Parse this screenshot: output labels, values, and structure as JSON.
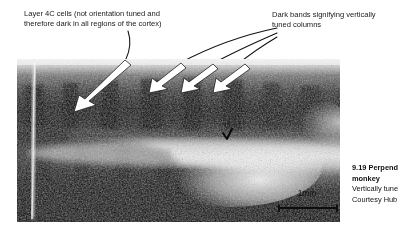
{
  "figure": {
    "type": "autoradiograph-micrograph",
    "annotations": {
      "left": {
        "text": "Layer 4C cells (not orientation tuned and\ntherefore dark in all regions of the cortex)",
        "line1": "Layer 4C cells (not orientation tuned and",
        "line2": "therefore dark in all regions of the cortex)",
        "arrow_count": 1
      },
      "right": {
        "text": "Dark bands signifying vertically\ntuned columns",
        "line1": "Dark bands signifying vertically",
        "line2": "tuned columns",
        "arrow_count": 3
      }
    },
    "scale_bar": {
      "label": "1mm",
      "length_px": 62
    },
    "caption": {
      "number": "9.19 ",
      "title_clipped": "Perpend",
      "title_line2": "monkey",
      "body_line1_clipped": "Vertically tune",
      "body_line2_clipped": "Courtesy Hub"
    },
    "colors": {
      "ink": "#000000",
      "paper": "#ffffff",
      "annotation_text": "#1a1a1a",
      "arrow_fill": "#ffffff",
      "arrow_stroke": "#111111",
      "leader_stroke": "#111111"
    }
  }
}
